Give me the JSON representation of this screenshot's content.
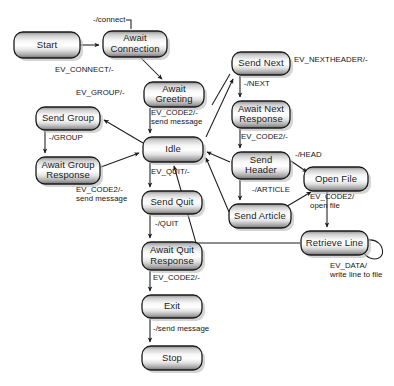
{
  "diagram": {
    "background_color": "#ffffff",
    "node_border_color": "#1b1b1b",
    "edge_color": "#1c1c1c",
    "nodes": [
      {
        "id": "start",
        "label": "Start",
        "lines": [
          "Start"
        ],
        "x": 14,
        "y": 32,
        "w": 66,
        "h": 26
      },
      {
        "id": "await_connection",
        "label": "Await Connection",
        "lines": [
          "Await",
          "Connection"
        ],
        "x": 103,
        "y": 31,
        "w": 64,
        "h": 26
      },
      {
        "id": "await_greeting",
        "label": "Await Greeting",
        "lines": [
          "Await",
          "Greeting"
        ],
        "x": 144,
        "y": 82,
        "w": 60,
        "h": 25
      },
      {
        "id": "send_group",
        "label": "Send Group",
        "lines": [
          "Send Group"
        ],
        "x": 36,
        "y": 107,
        "w": 64,
        "h": 23
      },
      {
        "id": "await_group_resp",
        "label": "Await Group Response",
        "lines": [
          "Await Group",
          "Response"
        ],
        "x": 36,
        "y": 157,
        "w": 64,
        "h": 27
      },
      {
        "id": "idle",
        "label": "Idle",
        "lines": [
          "Idle"
        ],
        "x": 143,
        "y": 137,
        "w": 60,
        "h": 25
      },
      {
        "id": "send_quit",
        "label": "Send Quit",
        "lines": [
          "Send Quit"
        ],
        "x": 142,
        "y": 191,
        "w": 60,
        "h": 23
      },
      {
        "id": "await_quit_resp",
        "label": "Await Quit Response",
        "lines": [
          "Await Quit",
          "Response"
        ],
        "x": 142,
        "y": 242,
        "w": 60,
        "h": 28
      },
      {
        "id": "exit",
        "label": "Exit",
        "lines": [
          "Exit"
        ],
        "x": 142,
        "y": 295,
        "w": 60,
        "h": 23
      },
      {
        "id": "stop",
        "label": "Stop",
        "lines": [
          "Stop"
        ],
        "x": 142,
        "y": 346,
        "w": 60,
        "h": 24
      },
      {
        "id": "send_next",
        "label": "Send Next",
        "lines": [
          "Send Next"
        ],
        "x": 232,
        "y": 52,
        "w": 58,
        "h": 23
      },
      {
        "id": "await_next_resp",
        "label": "Await Next Response",
        "lines": [
          "Await Next",
          "Response"
        ],
        "x": 232,
        "y": 101,
        "w": 58,
        "h": 27
      },
      {
        "id": "send_header",
        "label": "Send Header",
        "lines": [
          "Send",
          "Header"
        ],
        "x": 232,
        "y": 152,
        "w": 58,
        "h": 27
      },
      {
        "id": "send_article",
        "label": "Send Article",
        "lines": [
          "Send Article"
        ],
        "x": 229,
        "y": 204,
        "w": 62,
        "h": 24
      },
      {
        "id": "open_file",
        "label": "Open File",
        "lines": [
          "Open File"
        ],
        "x": 304,
        "y": 167,
        "w": 64,
        "h": 24
      },
      {
        "id": "retrieve_line",
        "label": "Retrieve Line",
        "lines": [
          "Retrieve Line"
        ],
        "x": 301,
        "y": 231,
        "w": 67,
        "h": 24
      }
    ],
    "edges": [
      {
        "id": "start-to-await-connection",
        "from": "start",
        "to": "await_connection",
        "label_lines": [
          "-/connect"
        ],
        "label_x": 93,
        "label_y": 22
      },
      {
        "id": "await-connection-to-await-greeting",
        "from": "await_connection",
        "to": "await_greeting",
        "label_lines": [
          "EV_CONNECT/-"
        ],
        "label_x": 55,
        "label_y": 72
      },
      {
        "id": "await-greeting-to-idle",
        "from": "await_greeting",
        "to": "idle",
        "label_lines": [
          "EV_CODE2/-",
          "send message"
        ],
        "label_x": 151,
        "label_y": 115
      },
      {
        "id": "idle-to-send-group",
        "from": "idle",
        "to": "send_group",
        "label_lines": [
          "EV_GROUP/-"
        ],
        "label_x": 76,
        "label_y": 95
      },
      {
        "id": "send-group-to-await-group-resp",
        "from": "send_group",
        "to": "await_group_resp",
        "label_lines": [
          "-/GROUP"
        ],
        "label_x": 49,
        "label_y": 140
      },
      {
        "id": "await-group-resp-to-idle",
        "from": "await_group_resp",
        "to": "idle",
        "label_lines": [
          "EV_CODE2/-",
          "send message"
        ],
        "label_x": 76,
        "label_y": 192
      },
      {
        "id": "idle-to-send-quit",
        "from": "idle",
        "to": "send_quit",
        "label_lines": [
          "EV_QUIT/-"
        ],
        "label_x": 151,
        "label_y": 174
      },
      {
        "id": "send-quit-to-await-quit-resp",
        "from": "send_quit",
        "to": "await_quit_resp",
        "label_lines": [
          "-/QUIT"
        ],
        "label_x": 155,
        "label_y": 226
      },
      {
        "id": "await-quit-resp-to-exit",
        "from": "await_quit_resp",
        "to": "exit",
        "label_lines": [
          "EV_CODE2/-"
        ],
        "label_x": 153,
        "label_y": 280
      },
      {
        "id": "exit-to-stop",
        "from": "exit",
        "to": "stop",
        "label_lines": [
          "-/send message"
        ],
        "label_x": 153,
        "label_y": 331
      },
      {
        "id": "idle-to-send-next",
        "from": "idle",
        "to": "send_next",
        "label_lines": [
          "EV_NEXTHEADER/-"
        ],
        "label_x": 294,
        "label_y": 62
      },
      {
        "id": "send-next-to-await-next-resp",
        "from": "send_next",
        "to": "await_next_resp",
        "label_lines": [
          "-/NEXT"
        ],
        "label_x": 244,
        "label_y": 86
      },
      {
        "id": "await-next-resp-to-send-header",
        "from": "await_next_resp",
        "to": "send_header",
        "label_lines": [
          "EV_CODE2/-"
        ],
        "label_x": 241,
        "label_y": 139
      },
      {
        "id": "send-header-to-open-file",
        "from": "send_header",
        "to": "open_file",
        "label_lines": [
          "-/HEAD"
        ],
        "label_x": 295,
        "label_y": 157
      },
      {
        "id": "send-header-to-send-article",
        "from": "send_header",
        "to": "send_article",
        "label_lines": [
          "-/ARTICLE"
        ],
        "label_x": 252,
        "label_y": 192
      },
      {
        "id": "send-article-to-open-file",
        "from": "send_article",
        "to": "open_file",
        "label_lines": [],
        "label_x": 0,
        "label_y": 0
      },
      {
        "id": "open-file-to-retrieve-line",
        "from": "open_file",
        "to": "retrieve_line",
        "label_lines": [
          "EV_CODE2/",
          "open file"
        ],
        "label_x": 310,
        "label_y": 199
      },
      {
        "id": "retrieve-line-to-idle",
        "from": "retrieve_line",
        "to": "idle",
        "label_lines": [],
        "label_x": 0,
        "label_y": 0
      },
      {
        "id": "retrieve-line-self-loop",
        "from": "retrieve_line",
        "to": "retrieve_line",
        "label_lines": [
          "EV_DATA/",
          "write line to file"
        ],
        "label_x": 330,
        "label_y": 268
      }
    ]
  }
}
